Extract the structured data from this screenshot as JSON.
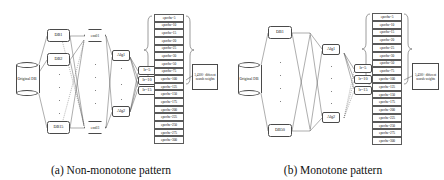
{
  "figure": {
    "panels": [
      {
        "id": "a",
        "caption": "(a) Non-monotone pattern",
        "source_db": "Original\nDB",
        "source_db_label": "Original DB",
        "databases": [
          "DB1",
          "DB2",
          "DB15"
        ],
        "ensembles": [
          "ens01",
          "ens03"
        ],
        "algorithms": [
          "Alg1",
          "Alg2"
        ],
        "learning_rates": [
          "lr=5",
          "lr=10",
          "lr=15"
        ],
        "epochs": [
          "epochs=5",
          "epochs=10",
          "epochs=15",
          "epochs=20",
          "epochs=25",
          "epochs=30",
          "epochs=50",
          "epochs=75",
          "epochs=100",
          "epochs=125",
          "epochs=150",
          "epochs=175",
          "epochs=200",
          "epochs=225",
          "epochs=250",
          "epochs=275",
          "epochs=300"
        ],
        "summary": "5,4300+\ndifferent\nneurals\nweights",
        "summary_label": "5,4300+ different neurals weights"
      },
      {
        "id": "b",
        "caption": "(b) Monotone pattern",
        "source_db": "Original\nDB",
        "source_db_label": "Original DB",
        "databases": [
          "DB1",
          "DB50"
        ],
        "ensembles": [],
        "algorithms": [
          "Alg1",
          "Alg2"
        ],
        "learning_rates": [
          "lr=5",
          "lr=10",
          "lr=15"
        ],
        "epochs": [
          "epochs=5",
          "epochs=10",
          "epochs=15",
          "epochs=20",
          "epochs=25",
          "epochs=30",
          "epochs=50",
          "epochs=75",
          "epochs=100",
          "epochs=125",
          "epochs=150",
          "epochs=175",
          "epochs=200",
          "epochs=225",
          "epochs=250",
          "epochs=275",
          "epochs=300"
        ],
        "summary": "5,4300+\ndifferent\nneurals\nweights",
        "summary_label": "5,4300+ different neurals weights"
      }
    ]
  },
  "colors": {
    "stroke": "#4a4a4a",
    "text": "#111111",
    "background": "#ffffff"
  }
}
